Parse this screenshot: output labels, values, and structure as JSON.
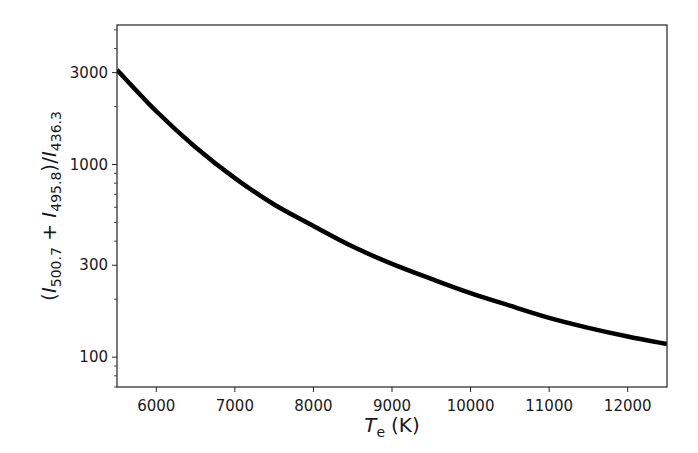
{
  "chart_data": {
    "type": "line",
    "title": "",
    "xlabel": "T_e (K)",
    "xlabel_parts": {
      "symbol": "T",
      "subscript": "e",
      "unit": "(K)"
    },
    "ylabel": "(I_500.7 + I_495.8)/I_436.3",
    "ylabel_parts": {
      "open": "(",
      "i1": "I",
      "s1": "500.7",
      "plus": " + ",
      "i2": "I",
      "s2": "495.8",
      "mid": ")/",
      "i3": "I",
      "s3": "436.3"
    },
    "xscale": "linear",
    "yscale": "log",
    "xlim": [
      5500,
      12500
    ],
    "ylim": [
      70,
      5300
    ],
    "xticks": [
      6000,
      7000,
      8000,
      9000,
      10000,
      11000,
      12000
    ],
    "xtick_labels": [
      "6000",
      "7000",
      "8000",
      "9000",
      "10000",
      "11000",
      "12000"
    ],
    "yticks": [
      100,
      300,
      1000,
      3000
    ],
    "ytick_labels": [
      "100",
      "300",
      "1000",
      "3000"
    ],
    "grid": false,
    "legend": null,
    "series": [
      {
        "name": "[O III] line ratio",
        "color": "#000000",
        "x": [
          5500,
          6000,
          6500,
          7000,
          7500,
          8000,
          8500,
          9000,
          9500,
          10000,
          10500,
          11000,
          11500,
          12000,
          12500
        ],
        "y": [
          3100,
          1890,
          1230,
          850,
          620,
          480,
          375,
          305,
          255,
          215,
          185,
          160,
          142,
          128,
          117
        ]
      }
    ]
  }
}
